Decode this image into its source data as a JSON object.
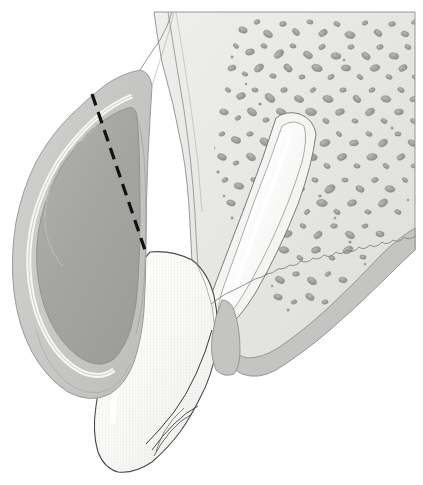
{
  "figure": {
    "title": "Dental cross-section: impacted tooth with associated cyst and planned surgical incision",
    "domain": "anatomical-illustration",
    "width": 423,
    "height": 485,
    "background_color": "#FFFFFF",
    "style": "grayscale stippled medical line drawing"
  },
  "palette": {
    "background": "#FFFFFF",
    "cortical_bone_light": "#E8E8E6",
    "bone_marrow_field": "#E2E2E0",
    "trabecula_gray": "#9A9A9A",
    "trabecula_dark": "#808080",
    "gingiva_mid_gray": "#C6C6C4",
    "gingiva_outer_gray": "#CFCFCD",
    "cyst_lesion_dark": "#A8A8A6",
    "cyst_lesion_core": "#A0A09E",
    "tooth_enamel_white": "#FDFDFD",
    "tooth_shade_light": "#F2F2F0",
    "tooth_dentin": "#EDEDEB",
    "outline_stroke": "#6E6E6E",
    "fine_line_stroke": "#555555",
    "dashed_incision": "#111111",
    "highlight_white": "#FFFFFF"
  },
  "structures": [
    {
      "id": "cortical-bone",
      "label": "Cortical bone plate",
      "color": "#E8E8E6",
      "description": "Outer pale bone shell occupying the upper and right portion of the section"
    },
    {
      "id": "trabecular-bone",
      "label": "Trabecular (cancellous) bone",
      "color": "#9A9A9A",
      "description": "Dense field of irregular gray marrow spaces filling the upper right maxilla",
      "trabecula_count": 260
    },
    {
      "id": "impacted-tooth",
      "label": "Impacted tooth (canine) within bone",
      "color": "#FDFDFD",
      "description": "Elongated light tooth outlined by a thin follicular line, crown directed downward"
    },
    {
      "id": "erupting-tooth",
      "label": "Erupting / displaced tooth crown",
      "color": "#FFFFFF",
      "description": "Large white crown emerging at lower left with cusp tip and incisal edge detail"
    },
    {
      "id": "cyst-lesion",
      "label": "Cystic lesion / soft tissue swelling",
      "color": "#A8A8A6",
      "description": "Large dark gray mass in the labial soft tissue at left"
    },
    {
      "id": "gingiva",
      "label": "Gingival / mucosal covering",
      "color": "#C6C6C4",
      "description": "Mid-gray band wrapping the lesion on the left and scalloping along the right alveolar crest"
    },
    {
      "id": "incision-line",
      "label": "Planned surgical incision line",
      "color": "#111111",
      "style": "dashed",
      "description": "Black dashed line running from the crest of the ridge obliquely down and to the right across the lesion",
      "start_point": [
        92,
        94
      ],
      "end_point": [
        147,
        256
      ]
    },
    {
      "id": "periodontal-space",
      "label": "Periodontal ligament space",
      "color": "#555555",
      "description": "Thin paired contour lines following the tooth root outline"
    }
  ],
  "annotations": {
    "text_labels": [],
    "note": "No text, numbers, axis ticks, legend or caption are rendered anywhere in this image."
  }
}
